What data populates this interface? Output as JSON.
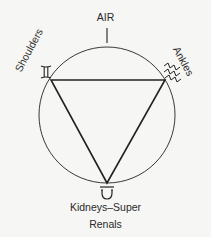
{
  "diagram": {
    "top_label": "AIR",
    "left_label": "Shoulders",
    "right_label": "Ankles",
    "bottom_label_line1": "Kidneys–Super",
    "bottom_label_line2": "Renals",
    "symbols": {
      "left": "gemini-symbol",
      "right": "aquarius-symbol",
      "bottom": "libra-symbol"
    },
    "shapes": [
      "circle",
      "inverted-triangle"
    ],
    "colors": {
      "line": "#222222",
      "background": "#f6f6f4"
    }
  }
}
